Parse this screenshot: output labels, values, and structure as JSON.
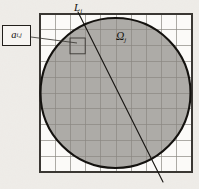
{
  "figure": {
    "caption_labels": {
      "line_label": "L",
      "line_subscript": "i",
      "region_label": "Ω",
      "region_subscript": "j",
      "cell_label": "a",
      "cell_subscript": "i,j"
    },
    "colors": {
      "background": "#f3f1ee",
      "grid_line": "#8a8782",
      "grid_border": "#3a3733",
      "circle_fill": "#a9a6a2",
      "circle_stroke": "#14120f",
      "ray_stroke": "#14120f",
      "leader_stroke": "#3a3733",
      "box_stroke": "#221f1b",
      "box_fill": "#f7f5f2",
      "text": "#15130f"
    }
  },
  "chart_data": {
    "type": "diagram",
    "canvas": {
      "width": 199,
      "height": 189
    },
    "grid": {
      "x0": 40,
      "y0": 14,
      "x1": 192,
      "y1": 172,
      "columns": 10,
      "rows": 10,
      "cell_width": 15.2,
      "cell_height": 15.8,
      "show_border": true,
      "line_width": 0.7,
      "border_width": 1.2
    },
    "circle": {
      "label": "Ω_j",
      "center_x": 115.5,
      "center_y": 93,
      "radius": 75,
      "filled": true,
      "stroke_width": 2.1
    },
    "ray": {
      "label": "L_i",
      "x_start": 78,
      "y_start": 12,
      "x_end": 163,
      "y_end": 182,
      "stroke_width": 1.1
    },
    "callout": {
      "label": "a_i,j",
      "box_x": 2,
      "box_y": 25,
      "box_width": 29,
      "box_height": 21,
      "leader_from_x": 31,
      "leader_from_y": 37,
      "leader_to_x": 77,
      "leader_to_y": 43,
      "target_cell_x": 70,
      "target_cell_y": 38,
      "target_cell_width": 15.2,
      "target_cell_height": 15.8
    },
    "text_labels": [
      {
        "text": "L_i",
        "x": 78,
        "y": 8,
        "style": "italic"
      },
      {
        "text": "Ω_j",
        "x": 121,
        "y": 37,
        "style": "italic"
      },
      {
        "text": "a_i,j",
        "x": 16,
        "y": 36,
        "style": "italic"
      }
    ]
  }
}
